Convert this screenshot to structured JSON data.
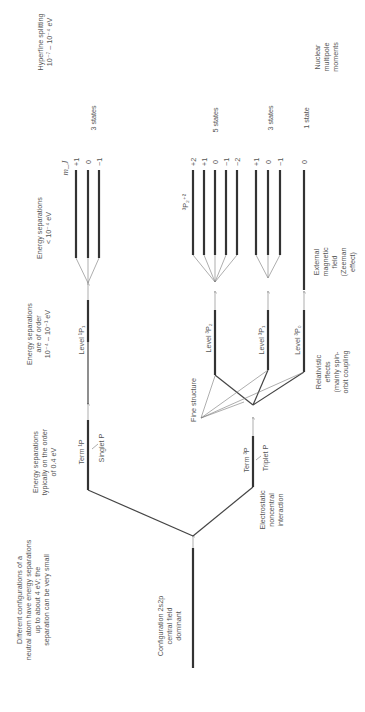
{
  "diagram": {
    "orientation": "rotated 90 degrees counter-clockwise; reads bottom to top",
    "columns": {
      "config_note": [
        "Different configurations of a",
        "neutral atom have energy separations",
        "up to about 4 eV; the",
        "separation can be very small"
      ],
      "term_note": [
        "Energy separations",
        "typically on the order",
        "of 0.4 eV"
      ],
      "level_note": [
        "Energy separations",
        "are of order",
        "10⁻⁴ – 10⁻¹ eV"
      ],
      "zeeman_note": [
        "Energy separations",
        "< 10⁻⁴ eV"
      ],
      "hyperfine_note": [
        "Hyperfine splitting",
        "10⁻⁷ – 10⁻⁴ eV"
      ]
    },
    "configuration": {
      "lines": [
        "Configuration 2s2p",
        "central field",
        "dominant"
      ]
    },
    "electrostatic": {
      "lines": [
        "Electrostatic",
        "noncentral",
        "interaction"
      ]
    },
    "relativistic": {
      "lines": [
        "Relativistic",
        "effects",
        "(mainly spin-",
        "orbit coupling"
      ]
    },
    "external_field": {
      "lines": [
        "External",
        "magnetic",
        "field",
        "(Zeeman",
        "effect)"
      ]
    },
    "nuclear": {
      "lines": [
        "Nuclear",
        "multipole",
        "moments"
      ]
    },
    "fine_structure": "Fine structure",
    "terms": {
      "singlet": {
        "term": "Term ¹P",
        "name": "Singlet P"
      },
      "triplet": {
        "term": "Term ³P",
        "name": "Triplet P"
      }
    },
    "levels": {
      "l1p1": "Level ¹P₁",
      "l3p2": "Level ³P₂",
      "l3p1": "Level ³P₁",
      "l3p0": "Level ³P₀"
    },
    "mj_header": "m_J",
    "substate_label": "³P₂⁺²",
    "groups": [
      {
        "id": "1P1",
        "mj": [
          "+1",
          "0",
          "−1"
        ],
        "count": "3 states"
      },
      {
        "id": "3P2",
        "mj": [
          "+2",
          "+1",
          "0",
          "−1",
          "−2"
        ],
        "count": "5 states"
      },
      {
        "id": "3P1",
        "mj": [
          "+1",
          "0",
          "−1"
        ],
        "count": "3 states"
      },
      {
        "id": "3P0",
        "mj": [
          "0"
        ],
        "count": "1 state"
      }
    ]
  }
}
